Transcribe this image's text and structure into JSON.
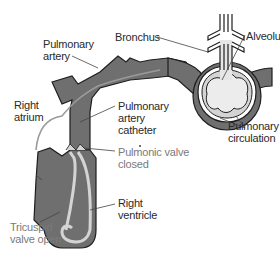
{
  "colors": {
    "vessel_fill": "#6f6f6f",
    "vessel_outline": "#1e1e1e",
    "alveolus_fill": "#e2e2e2",
    "light_wall": "#d4d4d4",
    "label_text": "#2a2a2a",
    "label_text_gray": "#7a7a7a",
    "leader_line": "#444444"
  },
  "labels": {
    "bronchus": "Bronchus",
    "alveolus": "Alveolus",
    "pulmonary_artery": [
      "Pulmonary",
      "artery"
    ],
    "right_atrium": [
      "Right",
      "atrium"
    ],
    "pulmonary_artery_catheter": [
      "Pulmonary",
      "artery",
      "catheter"
    ],
    "pulmonic_valve_closed": [
      "Pulmonic valve",
      "closed"
    ],
    "pulmonary_circulation": [
      "Pulmonary",
      "circulation"
    ],
    "right_ventricle": [
      "Right",
      "ventricle"
    ],
    "tricuspid_valve_open": [
      "Tricuspid",
      "valve open"
    ]
  }
}
